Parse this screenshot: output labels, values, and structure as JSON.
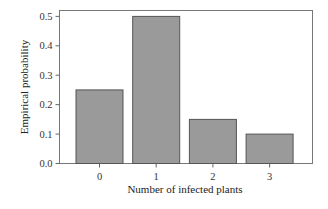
{
  "chart_data": {
    "type": "bar",
    "title": "",
    "xlabel": "Number of infected plants",
    "ylabel": "Empirical probability",
    "categories": [
      "0",
      "1",
      "2",
      "3"
    ],
    "values": [
      0.25,
      0.5,
      0.15,
      0.1
    ],
    "ylim": [
      0,
      0.52
    ],
    "yticks": [
      0.0,
      0.1,
      0.2,
      0.3,
      0.4,
      0.5
    ],
    "ytick_labels": [
      "0.0",
      "0.1",
      "0.2",
      "0.3",
      "0.4",
      "0.5"
    ],
    "grid": false,
    "legend": "none",
    "colors": {
      "bar_fill": "#9a9a9a",
      "bar_edge": "#555555",
      "axis": "#666666"
    }
  }
}
